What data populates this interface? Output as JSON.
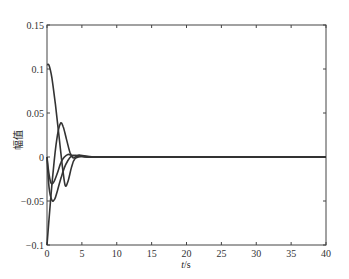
{
  "chart_data": {
    "type": "line",
    "title": "",
    "xlabel": "t/s",
    "ylabel": "幅值",
    "xlim": [
      0,
      40
    ],
    "ylim": [
      -0.1,
      0.15
    ],
    "xticks": [
      0,
      5,
      10,
      15,
      20,
      25,
      30,
      35,
      40
    ],
    "xtick_labels": [
      "0",
      "5",
      "10",
      "15",
      "20",
      "25",
      "30",
      "35",
      "40"
    ],
    "yticks": [
      -0.1,
      -0.05,
      0,
      0.05,
      0.1,
      0.15
    ],
    "ytick_labels": [
      "-0.1",
      "-0.05",
      "0",
      "0.05",
      "0.1",
      "0.15"
    ],
    "grid": false,
    "legend": null,
    "line_color": "#333333",
    "series": [
      {
        "name": "curve-1",
        "x": [
          0,
          0.3,
          0.7,
          1.2,
          1.7,
          2.2,
          2.6,
          3.0,
          3.5,
          4.0,
          5.0,
          6,
          8,
          10,
          40
        ],
        "y": [
          0.105,
          0.104,
          0.09,
          0.06,
          0.025,
          -0.01,
          -0.032,
          -0.028,
          -0.012,
          -0.002,
          0.001,
          0,
          0,
          0,
          0
        ]
      },
      {
        "name": "curve-2",
        "x": [
          0,
          0.4,
          0.9,
          1.4,
          1.9,
          2.3,
          2.8,
          3.3,
          3.8,
          4.5,
          5.5,
          7,
          10,
          40
        ],
        "y": [
          -0.1,
          -0.06,
          -0.015,
          0.02,
          0.038,
          0.035,
          0.02,
          0.005,
          -0.001,
          0.002,
          0.001,
          0,
          0,
          0
        ]
      },
      {
        "name": "curve-3",
        "x": [
          0,
          0.3,
          0.7,
          1.1,
          1.5,
          2.0,
          2.5,
          3.0,
          3.5,
          4.0,
          5.0,
          6.5,
          10,
          40
        ],
        "y": [
          0,
          -0.035,
          -0.049,
          -0.048,
          -0.038,
          -0.024,
          -0.012,
          -0.004,
          0.001,
          0.002,
          0.001,
          0,
          0,
          0
        ]
      },
      {
        "name": "curve-4",
        "x": [
          0,
          0.3,
          0.6,
          1.0,
          1.5,
          2.0,
          2.5,
          3.0,
          3.5,
          4.5,
          6,
          10,
          40
        ],
        "y": [
          0,
          -0.02,
          -0.03,
          -0.028,
          -0.018,
          -0.006,
          0.0,
          0.003,
          0.002,
          0.001,
          0,
          0,
          0
        ]
      }
    ]
  },
  "plot": {
    "xlabel_italic": "t",
    "xlabel_unit": "/s",
    "ylabel": "幅值"
  }
}
